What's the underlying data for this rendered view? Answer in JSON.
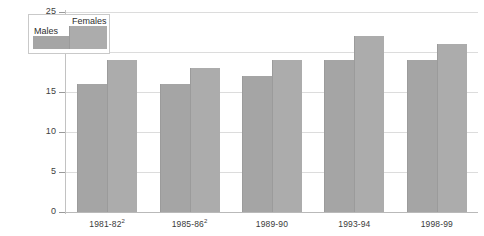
{
  "chart_data": {
    "type": "bar",
    "title": "",
    "subtitle": "",
    "xlabel": "",
    "ylabel": "",
    "ylim": [
      0,
      25
    ],
    "yticks": [
      0,
      5,
      10,
      15,
      20,
      25
    ],
    "ytick_labels": [
      "0",
      "5",
      "10",
      "15",
      "20",
      "25"
    ],
    "grid": true,
    "legend_position": "top-left",
    "categories": [
      "1981-82",
      "1985-86",
      "1989-90",
      "1993-94",
      "1998-99"
    ],
    "category_labels": [
      "1981-82",
      "1985-86",
      "1989-90",
      "1993-94",
      "1998-99"
    ],
    "category_footnotes": [
      "2",
      "2",
      "",
      "",
      ""
    ],
    "series": [
      {
        "name": "Males",
        "values": [
          16,
          16,
          17,
          19,
          19
        ],
        "color": "#a5a5a5"
      },
      {
        "name": "Females",
        "values": [
          19,
          18,
          19,
          22,
          21
        ],
        "color": "#acacac"
      }
    ]
  },
  "legend": {
    "males_label": "Males",
    "females_label": "Females"
  },
  "colors": {
    "males": "#a5a5a5",
    "females": "#acacac",
    "gridline": "#dcdcdc",
    "axis": "#c2c2c2",
    "text": "#3a3a3a"
  }
}
